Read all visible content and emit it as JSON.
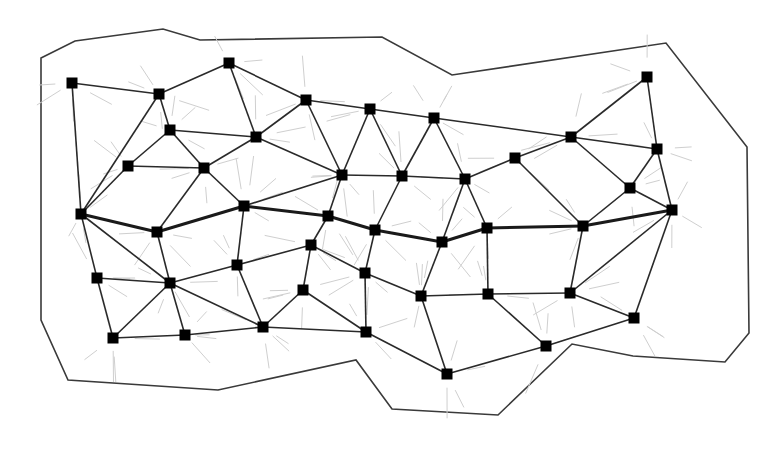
{
  "diagram": {
    "node_shape": "square",
    "colors": {
      "node": "#000000",
      "edge": "#2a2a2a",
      "path_edge": "#1a1a1a",
      "boundary": "#3a3a3a",
      "background_hint_lines": "#cfcfcf"
    },
    "nodes": [
      "n1",
      "n2",
      "n3",
      "n4",
      "n5",
      "n6",
      "n7",
      "n8",
      "n9",
      "n10",
      "n11",
      "n12",
      "n13",
      "n14",
      "n15",
      "n16",
      "n17",
      "n18",
      "n19",
      "n20",
      "n21",
      "n22",
      "n23",
      "n24",
      "n25",
      "n26",
      "n27",
      "n28",
      "n29",
      "n30",
      "n31",
      "n32",
      "n33",
      "n34",
      "n35",
      "n36",
      "n37",
      "n38",
      "n39",
      "n40",
      "n41",
      "n42",
      "n43"
    ],
    "edges": [
      [
        "n1",
        "n2"
      ],
      [
        "n1",
        "n20"
      ],
      [
        "n2",
        "n3"
      ],
      [
        "n2",
        "n4"
      ],
      [
        "n2",
        "n20"
      ],
      [
        "n3",
        "n7"
      ],
      [
        "n3",
        "n8"
      ],
      [
        "n4",
        "n5"
      ],
      [
        "n4",
        "n6"
      ],
      [
        "n4",
        "n7"
      ],
      [
        "n5",
        "n6"
      ],
      [
        "n5",
        "n20"
      ],
      [
        "n6",
        "n7"
      ],
      [
        "n6",
        "n21"
      ],
      [
        "n6",
        "n22"
      ],
      [
        "n7",
        "n8"
      ],
      [
        "n7",
        "n11"
      ],
      [
        "n8",
        "n9"
      ],
      [
        "n8",
        "n11"
      ],
      [
        "n9",
        "n10"
      ],
      [
        "n9",
        "n11"
      ],
      [
        "n9",
        "n12"
      ],
      [
        "n10",
        "n12"
      ],
      [
        "n10",
        "n13"
      ],
      [
        "n10",
        "n15"
      ],
      [
        "n11",
        "n12"
      ],
      [
        "n11",
        "n22"
      ],
      [
        "n11",
        "n23"
      ],
      [
        "n12",
        "n13"
      ],
      [
        "n12",
        "n24"
      ],
      [
        "n13",
        "n14"
      ],
      [
        "n13",
        "n25"
      ],
      [
        "n13",
        "n26"
      ],
      [
        "n14",
        "n15"
      ],
      [
        "n14",
        "n27"
      ],
      [
        "n15",
        "n16"
      ],
      [
        "n15",
        "n17"
      ],
      [
        "n15",
        "n18"
      ],
      [
        "n16",
        "n17"
      ],
      [
        "n17",
        "n18"
      ],
      [
        "n17",
        "n19"
      ],
      [
        "n18",
        "n19"
      ],
      [
        "n18",
        "n27"
      ],
      [
        "n19",
        "n36"
      ],
      [
        "n19",
        "n37"
      ],
      [
        "n20",
        "n28"
      ],
      [
        "n20",
        "n29"
      ],
      [
        "n21",
        "n29"
      ],
      [
        "n22",
        "n30"
      ],
      [
        "n23",
        "n31"
      ],
      [
        "n24",
        "n32"
      ],
      [
        "n25",
        "n34"
      ],
      [
        "n26",
        "n35"
      ],
      [
        "n27",
        "n36"
      ],
      [
        "n28",
        "n29"
      ],
      [
        "n28",
        "n38"
      ],
      [
        "n29",
        "n30"
      ],
      [
        "n29",
        "n38"
      ],
      [
        "n29",
        "n39"
      ],
      [
        "n29",
        "n40"
      ],
      [
        "n30",
        "n31"
      ],
      [
        "n30",
        "n40"
      ],
      [
        "n31",
        "n32"
      ],
      [
        "n31",
        "n33"
      ],
      [
        "n32",
        "n34"
      ],
      [
        "n32",
        "n41"
      ],
      [
        "n33",
        "n40"
      ],
      [
        "n33",
        "n41"
      ],
      [
        "n34",
        "n35"
      ],
      [
        "n34",
        "n42"
      ],
      [
        "n35",
        "n36"
      ],
      [
        "n35",
        "n43"
      ],
      [
        "n36",
        "n37"
      ],
      [
        "n37",
        "n43"
      ],
      [
        "n38",
        "n39"
      ],
      [
        "n39",
        "n40"
      ],
      [
        "n40",
        "n41"
      ],
      [
        "n41",
        "n42"
      ],
      [
        "n42",
        "n43"
      ]
    ],
    "highlighted_path": [
      "n20",
      "n21",
      "n22",
      "n23",
      "n24",
      "n25",
      "n26",
      "n27",
      "n19"
    ]
  }
}
